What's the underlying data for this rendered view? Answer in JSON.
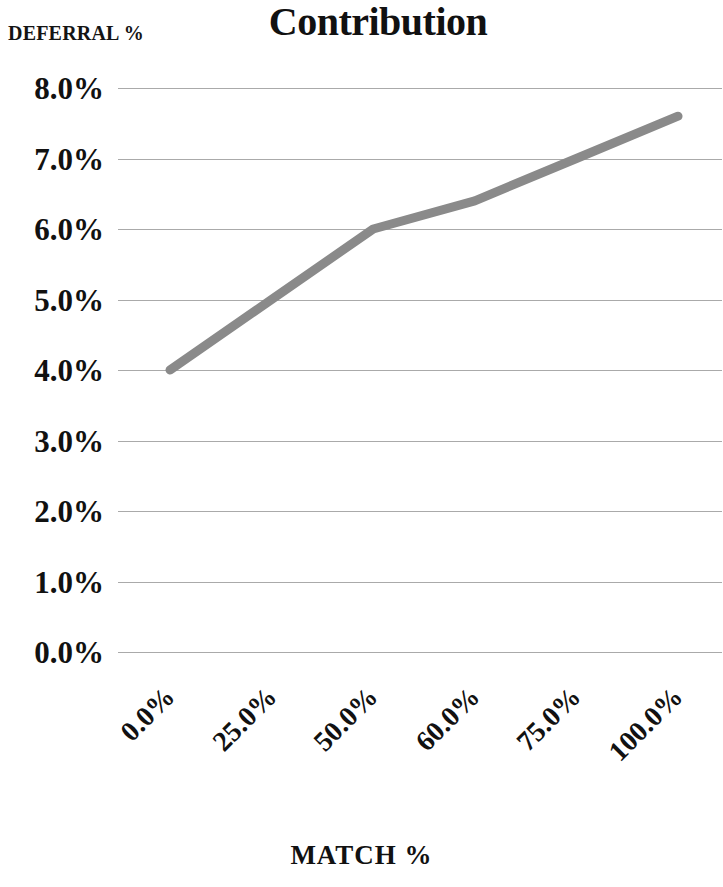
{
  "chart_data": {
    "type": "line",
    "title": "Contribution",
    "xlabel": "MATCH %",
    "ylabel": "DEFERRAL %",
    "categories": [
      "0.0%",
      "25.0%",
      "50.0%",
      "60.0%",
      "75.0%",
      "100.0%"
    ],
    "values": [
      4.0,
      5.0,
      6.0,
      6.4,
      7.0,
      7.6
    ],
    "value_labels": [
      "4.0%",
      "5.0%",
      "6.0%",
      "6.4%",
      "7.0%",
      "7.6%"
    ],
    "series": [
      {
        "name": "Contribution",
        "values": [
          4.0,
          5.0,
          6.0,
          6.4,
          7.0,
          7.6
        ],
        "color": "#8a8a8a"
      }
    ],
    "ylim": [
      0.0,
      8.0
    ],
    "ytick_values": [
      8.0,
      7.0,
      6.0,
      5.0,
      4.0,
      3.0,
      2.0,
      1.0,
      0.0
    ],
    "ytick_labels": [
      "8.0%",
      "7.0%",
      "6.0%",
      "5.0%",
      "4.0%",
      "3.0%",
      "2.0%",
      "1.0%",
      "0.0%"
    ],
    "grid": true,
    "gridline_color": "#9b9b9b",
    "legend": "none",
    "xtick_rotation": -45,
    "background_color": "#ffffff",
    "text_color": "#111111"
  }
}
